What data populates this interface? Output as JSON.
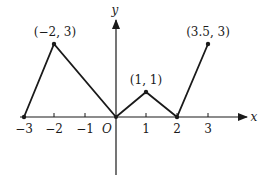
{
  "diagram": {
    "type": "piecewise-linear-graph",
    "axes": {
      "x_label": "x",
      "y_label": "y",
      "origin_label": "O",
      "x_ticks": [
        {
          "value": -3,
          "label": "−3"
        },
        {
          "value": -2,
          "label": "−2"
        },
        {
          "value": -1,
          "label": "−1"
        },
        {
          "value": 1,
          "label": "1"
        },
        {
          "value": 2,
          "label": "2"
        },
        {
          "value": 3,
          "label": "3"
        }
      ]
    },
    "points": [
      {
        "x": -3,
        "y": 0,
        "label": ""
      },
      {
        "x": -2,
        "y": 3,
        "label": "(−2, 3)"
      },
      {
        "x": 0,
        "y": 0,
        "label": ""
      },
      {
        "x": 1,
        "y": 1,
        "label": "(1, 1)"
      },
      {
        "x": 2,
        "y": 0,
        "label": ""
      },
      {
        "x": 3.5,
        "y": 3,
        "label": "(3.5, 3)"
      }
    ],
    "colors": {
      "line": "#1a1a1a",
      "background": "#ffffff"
    }
  }
}
